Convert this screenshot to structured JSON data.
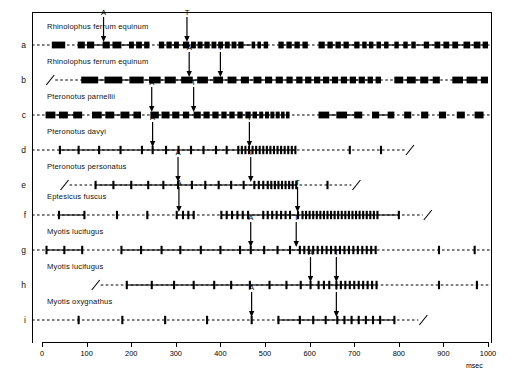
{
  "figure": {
    "title": "",
    "axis": {
      "label": "msec",
      "min": 0,
      "max": 1000,
      "step": 100,
      "ticks": [
        0,
        100,
        200,
        300,
        400,
        500,
        600,
        700,
        800,
        900,
        1000
      ],
      "tick_labels": [
        "0",
        "100",
        "200",
        "300",
        "400",
        "500",
        "600",
        "700",
        "800",
        "900",
        "1000"
      ]
    },
    "markers": {
      "approach_label": "A",
      "terminal_label": "T"
    },
    "colors": {
      "ink": "#000000",
      "background": "#ffffff"
    }
  },
  "chart_data": {
    "type": "scatter",
    "title": "",
    "xlabel": "msec",
    "ylabel": "",
    "xlim": [
      0,
      1000
    ],
    "grid": false,
    "legend": "none",
    "row_labels": [
      "a",
      "b",
      "c",
      "d",
      "e",
      "f",
      "g",
      "h",
      "i"
    ],
    "series": [
      {
        "row": "a",
        "name": "Rhinolophus ferrum equinum",
        "pulse_style": "bar",
        "start_break": false,
        "end_break": false,
        "A": 138,
        "T": 325,
        "pulses": [
          [
            22,
            52
          ],
          [
            80,
            96
          ],
          [
            101,
            117
          ],
          [
            136,
            152
          ],
          [
            158,
            178
          ],
          [
            195,
            206
          ],
          [
            211,
            224
          ],
          [
            229,
            241
          ],
          [
            262,
            274
          ],
          [
            279,
            291
          ],
          [
            296,
            307
          ],
          [
            316,
            330
          ],
          [
            334,
            345
          ],
          [
            349,
            360
          ],
          [
            364,
            376
          ],
          [
            380,
            391
          ],
          [
            395,
            406
          ],
          [
            410,
            421
          ],
          [
            425,
            436
          ],
          [
            440,
            452
          ],
          [
            470,
            478
          ],
          [
            483,
            491
          ],
          [
            497,
            507
          ],
          [
            530,
            542
          ],
          [
            548,
            560
          ],
          [
            566,
            578
          ],
          [
            584,
            596
          ],
          [
            620,
            634
          ],
          [
            640,
            652
          ],
          [
            658,
            670
          ],
          [
            676,
            688
          ],
          [
            700,
            712
          ],
          [
            718,
            728
          ],
          [
            733,
            743
          ],
          [
            750,
            760
          ],
          [
            767,
            777
          ],
          [
            790,
            800
          ],
          [
            810,
            820
          ],
          [
            828,
            838
          ],
          [
            856,
            868
          ],
          [
            880,
            893
          ],
          [
            900,
            913
          ],
          [
            920,
            933
          ],
          [
            945,
            960
          ],
          [
            968,
            983
          ],
          [
            988,
            1000
          ]
        ]
      },
      {
        "row": "b",
        "name": "Rhinolophus ferrum equinum",
        "pulse_style": "bar",
        "start_break": true,
        "end_break": false,
        "A": 330,
        "T": 400,
        "pulses": [
          [
            88,
            126
          ],
          [
            140,
            180
          ],
          [
            196,
            228
          ],
          [
            240,
            266
          ],
          [
            275,
            300
          ],
          [
            312,
            338
          ],
          [
            348,
            372
          ],
          [
            384,
            406
          ],
          [
            416,
            436
          ],
          [
            446,
            464
          ],
          [
            474,
            492
          ],
          [
            500,
            516
          ],
          [
            524,
            540
          ],
          [
            548,
            562
          ],
          [
            570,
            584
          ],
          [
            590,
            604
          ],
          [
            610,
            624
          ],
          [
            630,
            644
          ],
          [
            650,
            664
          ],
          [
            670,
            684
          ],
          [
            690,
            704
          ],
          [
            710,
            724
          ],
          [
            730,
            742
          ],
          [
            748,
            760
          ],
          [
            790,
            810
          ],
          [
            818,
            838
          ],
          [
            848,
            866
          ],
          [
            876,
            892
          ],
          [
            920,
            944
          ],
          [
            952,
            976
          ],
          [
            984,
            1000
          ]
        ]
      },
      {
        "row": "c",
        "name": "Pteronotus parnellii",
        "pulse_style": "bar",
        "start_break": false,
        "end_break": false,
        "A": 246,
        "T": 340,
        "pulses": [
          [
            8,
            30
          ],
          [
            38,
            58
          ],
          [
            70,
            90
          ],
          [
            112,
            134
          ],
          [
            142,
            162
          ],
          [
            176,
            196
          ],
          [
            205,
            222
          ],
          [
            243,
            262
          ],
          [
            268,
            286
          ],
          [
            292,
            308
          ],
          [
            316,
            330
          ],
          [
            340,
            356
          ],
          [
            362,
            376
          ],
          [
            382,
            396
          ],
          [
            402,
            414
          ],
          [
            420,
            432
          ],
          [
            438,
            450
          ],
          [
            456,
            468
          ],
          [
            472,
            482
          ],
          [
            487,
            496
          ],
          [
            500,
            509
          ],
          [
            512,
            521
          ],
          [
            524,
            533
          ],
          [
            536,
            544
          ],
          [
            547,
            555
          ],
          [
            620,
            644
          ],
          [
            660,
            684
          ],
          [
            700,
            718
          ],
          [
            740,
            756
          ],
          [
            775,
            790
          ],
          [
            812,
            828
          ],
          [
            850,
            866
          ],
          [
            890,
            906
          ],
          [
            930,
            948
          ],
          [
            970,
            990
          ]
        ]
      },
      {
        "row": "d",
        "name": "Pteronotus davyi",
        "pulse_style": "tick",
        "start_break": false,
        "end_break": true,
        "A": 248,
        "T": 465,
        "pulses_tick": [
          40,
          82,
          128,
          176,
          224,
          248,
          278,
          306,
          334,
          362,
          390,
          414,
          440,
          448,
          456,
          464,
          472,
          480,
          488,
          496,
          504,
          512,
          520,
          528,
          536,
          544,
          552,
          560,
          568,
          690,
          760
        ]
      },
      {
        "row": "e",
        "name": "Pteronotus personatus",
        "pulse_style": "tick",
        "start_break": true,
        "end_break": true,
        "A": 305,
        "T": 468,
        "pulses_tick": [
          120,
          160,
          200,
          238,
          272,
          305,
          336,
          366,
          396,
          424,
          452,
          476,
          486,
          496,
          506,
          514,
          522,
          530,
          538,
          546,
          554,
          562,
          570,
          640
        ]
      },
      {
        "row": "f",
        "name": "Eptesicus fuscus",
        "pulse_style": "tick",
        "start_break": false,
        "end_break": true,
        "A": 307,
        "T": 573,
        "pulses_tick": [
          38,
          95,
          168,
          236,
          302,
          316,
          328,
          340,
          402,
          414,
          426,
          438,
          450,
          462,
          496,
          506,
          516,
          526,
          536,
          546,
          556,
          574,
          584,
          592,
          600,
          608,
          616,
          624,
          632,
          640,
          648,
          656,
          664,
          672,
          680,
          688,
          696,
          704,
          712,
          720,
          728,
          736,
          744,
          752,
          800
        ]
      },
      {
        "row": "g",
        "name": "Myotis lucifugus",
        "pulse_style": "tick",
        "start_break": false,
        "end_break": false,
        "A": 468,
        "T": 570,
        "pulses_tick": [
          10,
          50,
          90,
          178,
          222,
          268,
          310,
          356,
          400,
          444,
          468,
          498,
          528,
          556,
          578,
          588,
          598,
          608,
          618,
          628,
          638,
          648,
          658,
          668,
          678,
          688,
          698,
          708,
          718,
          728,
          738,
          748,
          890,
          970
        ]
      },
      {
        "row": "h",
        "name": "Myotis lucifugus",
        "pulse_style": "tick",
        "start_break": true,
        "end_break": false,
        "A": 602,
        "T": 660,
        "pulses_tick": [
          190,
          246,
          296,
          340,
          386,
          424,
          466,
          510,
          548,
          580,
          602,
          620,
          632,
          644,
          660,
          670,
          680,
          690,
          700,
          710,
          720,
          730,
          740,
          750,
          890,
          975
        ]
      },
      {
        "row": "i",
        "name": "Myotis oxygnathus",
        "pulse_style": "tick",
        "start_break": false,
        "end_break": true,
        "A": 470,
        "T": 660,
        "pulses_tick": [
          82,
          180,
          276,
          370,
          470,
          530,
          578,
          608,
          636,
          662,
          678,
          694,
          710,
          726,
          742,
          758,
          790
        ]
      }
    ]
  }
}
